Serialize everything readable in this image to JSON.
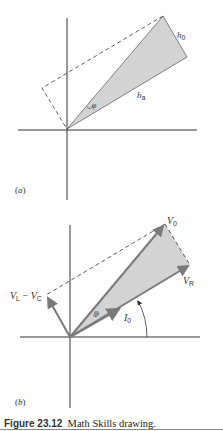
{
  "figure": {
    "caption_number": "Figure 23.12",
    "caption_text": "Math Skills drawing.",
    "colors": {
      "axis": "#333333",
      "fill": "#d3d3d3",
      "vector": "#7a7a7a",
      "dashed": "#333333"
    }
  },
  "panel_a": {
    "label_open": "(",
    "label_letter": "a",
    "label_close": ")",
    "labels": {
      "h0_main": "h",
      "h0_sub": "0",
      "ha_main": "h",
      "ha_sub": "a",
      "phi": "φ"
    }
  },
  "panel_b": {
    "label_open": "(",
    "label_letter": "b",
    "label_close": ")",
    "labels": {
      "v0_main": "V",
      "v0_sub": "0",
      "vr_main": "V",
      "vr_sub": "R",
      "vl_main": "V",
      "vl_sub": "L",
      "minus": " − ",
      "vc_main": "V",
      "vc_sub": "C",
      "i0_main": "I",
      "i0_sub": "0",
      "phi": "φ"
    }
  }
}
